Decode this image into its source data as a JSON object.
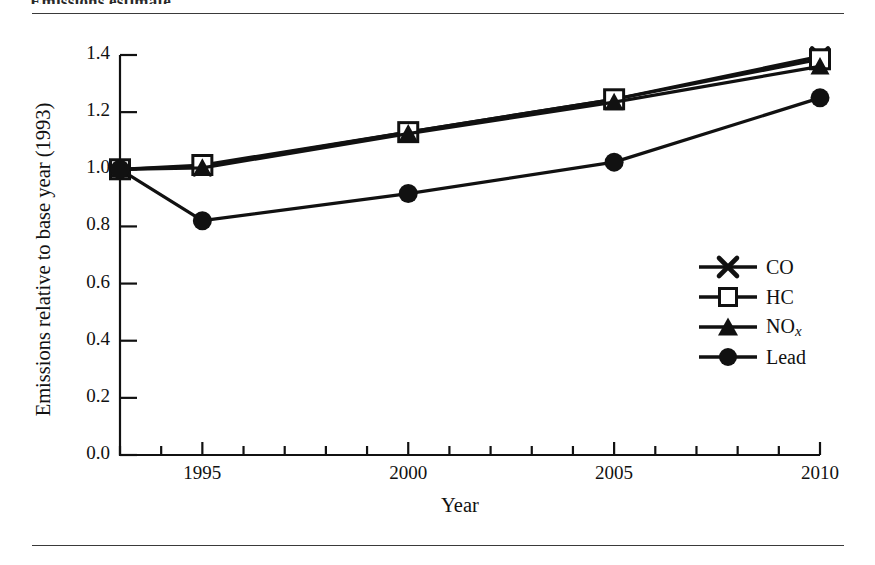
{
  "document": {
    "top_caption": "Emissions estimate",
    "top_rule": "horizontal-rule",
    "bottom_rule": "horizontal-rule"
  },
  "chart_data": {
    "type": "line",
    "title": "",
    "xlabel": "Year",
    "ylabel": "Emissions relative to base year (1993)",
    "xlim": [
      1993,
      2010
    ],
    "ylim": [
      0.0,
      1.4
    ],
    "grid": false,
    "legend_position": "center-right",
    "x_tick_labels": [
      "1995",
      "2000",
      "2005",
      "2010"
    ],
    "x_tick_values": [
      1995,
      2000,
      2005,
      2010
    ],
    "x_minor_ticks_every": 1,
    "y_tick_labels": [
      "0.0",
      "0.2",
      "0.4",
      "0.6",
      "0.8",
      "1.0",
      "1.2",
      "1.4"
    ],
    "y_tick_values": [
      0.0,
      0.2,
      0.4,
      0.6,
      0.8,
      1.0,
      1.2,
      1.4
    ],
    "x": [
      1993,
      1995,
      2000,
      2005,
      2010
    ],
    "series": [
      {
        "name": "CO",
        "marker": "x-cross",
        "values": [
          1.0,
          1.01,
          1.13,
          1.245,
          1.395
        ]
      },
      {
        "name": "HC",
        "marker": "open-square",
        "values": [
          1.0,
          1.015,
          1.13,
          1.245,
          1.385
        ]
      },
      {
        "name": "NOx",
        "marker": "filled-triangle",
        "values": [
          1.0,
          1.005,
          1.125,
          1.235,
          1.36
        ]
      },
      {
        "name": "Lead",
        "marker": "filled-circle",
        "values": [
          1.0,
          0.82,
          0.915,
          1.025,
          1.25
        ]
      }
    ]
  },
  "legend": {
    "items": [
      {
        "label": "CO",
        "marker": "x-cross"
      },
      {
        "label": "HC",
        "marker": "open-square"
      },
      {
        "label": "NO",
        "sub": "x",
        "marker": "filled-triangle"
      },
      {
        "label": "Lead",
        "marker": "filled-circle"
      }
    ]
  },
  "colors": {
    "ink": "#111111",
    "rule": "#3a3a3a",
    "background": "#ffffff"
  }
}
